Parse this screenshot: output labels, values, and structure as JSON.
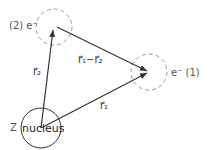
{
  "diagram": {
    "labels": {
      "electron2": "(2) e⁻",
      "electron1": "e⁻ (1)",
      "nucleus": "nucleus",
      "charge": "Z",
      "r1": "r⃗₁",
      "r2": "r⃗₂",
      "r1_minus_r2": "r⃗₁−r⃗₂"
    },
    "colors": {
      "line": "#333333",
      "dashed_circle": "#999999",
      "nucleus_circle": "#333333"
    }
  }
}
